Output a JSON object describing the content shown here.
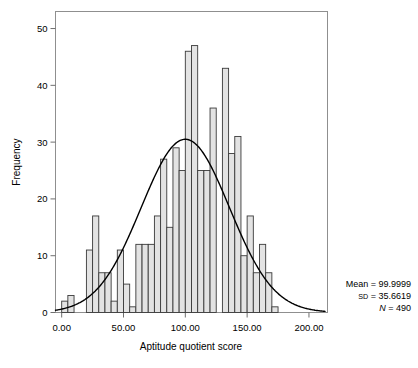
{
  "chart_data": {
    "type": "bar",
    "title": "",
    "subtitle": "",
    "xlabel": "Aptitude quotient score",
    "ylabel": "Frequency",
    "xlim": [
      -5,
      215
    ],
    "ylim": [
      0,
      53
    ],
    "grid": false,
    "bin_width": 5,
    "xticks": [
      0,
      50,
      100,
      150,
      200
    ],
    "xtick_labels": [
      "0.00",
      "50.00",
      "100.00",
      "150.00",
      "200.00"
    ],
    "yticks": [
      0,
      10,
      20,
      30,
      40,
      50
    ],
    "ytick_labels": [
      "0",
      "10",
      "20",
      "30",
      "40",
      "50"
    ],
    "bar_fill": "#e3e3e3",
    "bar_stroke": "#3a3a3a",
    "curve_color": "#000000",
    "frame_color": "#8a8a8a",
    "bins": [
      {
        "x0": 0,
        "x1": 5,
        "value": 2
      },
      {
        "x0": 5,
        "x1": 10,
        "value": 3
      },
      {
        "x0": 10,
        "x1": 15,
        "value": 0
      },
      {
        "x0": 15,
        "x1": 20,
        "value": 0
      },
      {
        "x0": 20,
        "x1": 25,
        "value": 11
      },
      {
        "x0": 25,
        "x1": 30,
        "value": 17
      },
      {
        "x0": 30,
        "x1": 35,
        "value": 7
      },
      {
        "x0": 35,
        "x1": 40,
        "value": 7
      },
      {
        "x0": 40,
        "x1": 45,
        "value": 2
      },
      {
        "x0": 45,
        "x1": 50,
        "value": 11
      },
      {
        "x0": 50,
        "x1": 55,
        "value": 5
      },
      {
        "x0": 55,
        "x1": 60,
        "value": 1
      },
      {
        "x0": 60,
        "x1": 65,
        "value": 12
      },
      {
        "x0": 65,
        "x1": 70,
        "value": 12
      },
      {
        "x0": 70,
        "x1": 75,
        "value": 12
      },
      {
        "x0": 75,
        "x1": 80,
        "value": 17
      },
      {
        "x0": 80,
        "x1": 85,
        "value": 27
      },
      {
        "x0": 85,
        "x1": 90,
        "value": 15
      },
      {
        "x0": 90,
        "x1": 95,
        "value": 29
      },
      {
        "x0": 95,
        "x1": 100,
        "value": 25
      },
      {
        "x0": 100,
        "x1": 105,
        "value": 46
      },
      {
        "x0": 105,
        "x1": 110,
        "value": 47
      },
      {
        "x0": 110,
        "x1": 115,
        "value": 25
      },
      {
        "x0": 115,
        "x1": 120,
        "value": 25
      },
      {
        "x0": 120,
        "x1": 125,
        "value": 36
      },
      {
        "x0": 125,
        "x1": 130,
        "value": 0
      },
      {
        "x0": 130,
        "x1": 135,
        "value": 43
      },
      {
        "x0": 135,
        "x1": 140,
        "value": 28
      },
      {
        "x0": 140,
        "x1": 145,
        "value": 31
      },
      {
        "x0": 145,
        "x1": 150,
        "value": 10
      },
      {
        "x0": 150,
        "x1": 155,
        "value": 17
      },
      {
        "x0": 155,
        "x1": 160,
        "value": 7
      },
      {
        "x0": 160,
        "x1": 165,
        "value": 12
      },
      {
        "x0": 165,
        "x1": 170,
        "value": 7
      },
      {
        "x0": 170,
        "x1": 175,
        "value": 1
      }
    ],
    "normal_curve": {
      "mean": 99.9999,
      "sd": 35.6619,
      "n": 490,
      "peak_frequency": 30.5,
      "x_start": -5,
      "x_end": 213
    },
    "annotations": {
      "mean_label": "Mean = 99.9999",
      "sd_prefix": "SD",
      "sd_value": " = 35.6619",
      "n_prefix": "N",
      "n_value": " = 490"
    }
  }
}
